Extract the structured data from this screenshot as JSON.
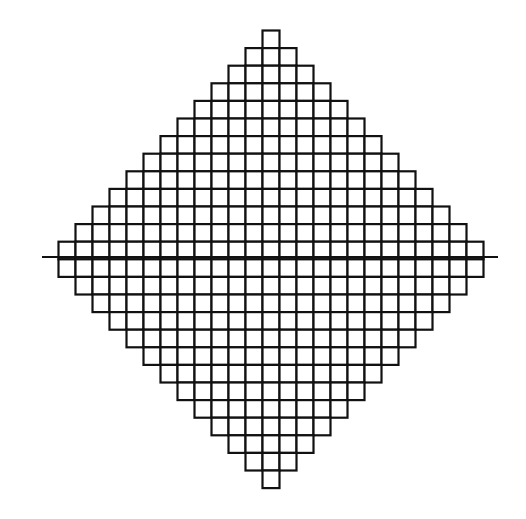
{
  "diagram": {
    "type": "diamond-lattice-grid",
    "columns": 25,
    "rows": 26,
    "row_widths": [
      1,
      3,
      5,
      7,
      9,
      11,
      13,
      15,
      17,
      19,
      21,
      23,
      25,
      25,
      23,
      21,
      19,
      17,
      15,
      13,
      11,
      9,
      7,
      5,
      3,
      1
    ],
    "cell_width": 17,
    "cell_height": 17.6,
    "origin_x": 58.5,
    "origin_y": 30.5,
    "axis": {
      "y": 257,
      "x_start": 42,
      "x_end": 498
    },
    "stroke_color": "#111111",
    "fill_color": "#ffffff",
    "stroke_width": 2.2
  }
}
